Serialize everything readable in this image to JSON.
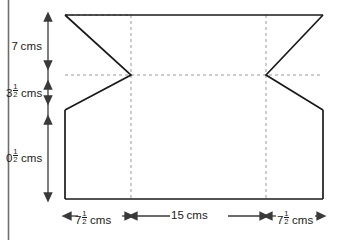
{
  "diagram": {
    "type": "technical-drawing",
    "colors": {
      "outline": "#1a1a1a",
      "dashed": "#8a8a8a",
      "dimension": "#3a3a3a",
      "page_rule": "#6e6e6e",
      "background": "#ffffff"
    },
    "vertical_dimensions": [
      {
        "id": "top",
        "value": "7",
        "fraction": null,
        "unit": "cms",
        "label": "7 cms"
      },
      {
        "id": "middle",
        "value": "3",
        "fraction": "1/2",
        "unit": "cms",
        "label": "3½ cms"
      },
      {
        "id": "bottom",
        "value": "0",
        "fraction": "1/2",
        "unit": "cms",
        "label": "0½ cms"
      }
    ],
    "horizontal_dimensions": [
      {
        "id": "left",
        "value": "7",
        "fraction": "1/2",
        "unit": "cms",
        "label": "7½ cms"
      },
      {
        "id": "center",
        "value": "15",
        "fraction": null,
        "unit": "cms",
        "label": "15 cms"
      },
      {
        "id": "right",
        "value": "7",
        "fraction": "1/2",
        "unit": "cms",
        "label": "7½ cms"
      }
    ],
    "fraction_parts": {
      "numerator": "1",
      "denominator": "2"
    }
  }
}
